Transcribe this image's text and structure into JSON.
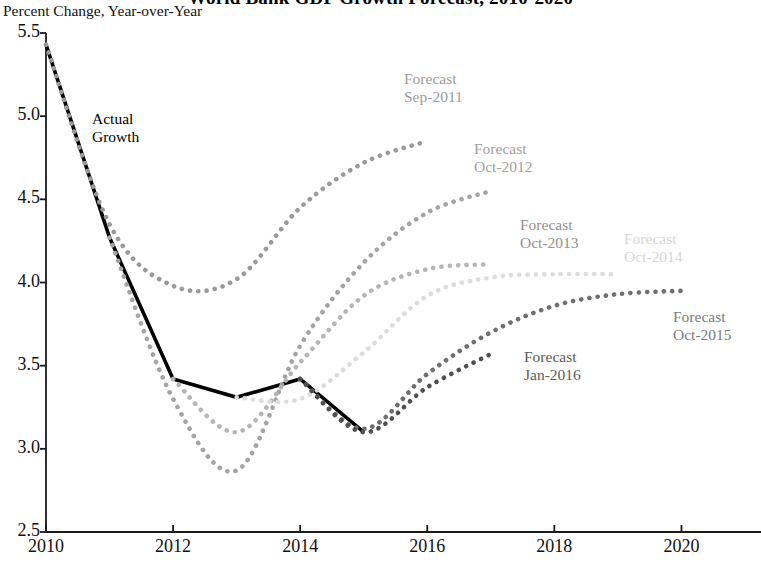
{
  "chart_data": {
    "type": "line",
    "title": "World Bank GDP Growth Forecast, 2010-2020",
    "subtitle": "Percent Change, Year-over-Year",
    "xlabel": "",
    "ylabel": "Percent Change, Year-over-Year",
    "xlim": [
      2010,
      2021
    ],
    "ylim": [
      2.5,
      5.5
    ],
    "ytick_labels": [
      "5.5",
      "5.0",
      "4.5",
      "4.0",
      "3.5",
      "3.0",
      "2.5"
    ],
    "yticks": [
      5.5,
      5.0,
      4.5,
      4.0,
      3.5,
      3.0,
      2.5
    ],
    "xtick_labels": [
      "2010",
      "2012",
      "2014",
      "2016",
      "2018",
      "2020"
    ],
    "xticks": [
      2010,
      2012,
      2014,
      2016,
      2018,
      2020
    ],
    "grid": false,
    "legend": "inline-annotations",
    "series": [
      {
        "name": "Actual Growth",
        "style": "solid",
        "color": "#000000",
        "x": [
          2010,
          2011,
          2012,
          2013,
          2014,
          2015
        ],
        "values": [
          5.43,
          4.27,
          3.42,
          3.31,
          3.42,
          3.1
        ]
      },
      {
        "name": "Forecast Sep-2011",
        "style": "dotted",
        "color": "#9a9a9a",
        "x": [
          2010,
          2011,
          2012,
          2013,
          2014,
          2015,
          2016
        ],
        "values": [
          5.43,
          4.35,
          3.98,
          4.02,
          4.45,
          4.72,
          4.85
        ]
      },
      {
        "name": "Forecast Oct-2012",
        "style": "dotted",
        "color": "#a4a4a4",
        "x": [
          2011,
          2012,
          2013,
          2014,
          2015,
          2016,
          2017
        ],
        "values": [
          4.27,
          3.3,
          2.87,
          3.62,
          4.12,
          4.42,
          4.55
        ]
      },
      {
        "name": "Forecast Oct-2013",
        "style": "dotted",
        "color": "#b5b5b5",
        "x": [
          2012,
          2013,
          2014,
          2015,
          2016,
          2017
        ],
        "values": [
          3.42,
          3.1,
          3.52,
          3.92,
          4.08,
          4.11
        ]
      },
      {
        "name": "Forecast Oct-2014",
        "style": "dotted",
        "color": "#dcdcdc",
        "x": [
          2013,
          2014,
          2015,
          2016,
          2017,
          2018,
          2019
        ],
        "values": [
          3.31,
          3.3,
          3.58,
          3.92,
          4.03,
          4.05,
          4.05
        ]
      },
      {
        "name": "Forecast Oct-2015",
        "style": "dotted",
        "color": "#6f6f6f",
        "x": [
          2014,
          2015,
          2016,
          2017,
          2018,
          2019,
          2020
        ],
        "values": [
          3.42,
          3.12,
          3.45,
          3.7,
          3.86,
          3.93,
          3.95
        ]
      },
      {
        "name": "Forecast Jan-2016",
        "style": "dotted",
        "color": "#4f4f4f",
        "x": [
          2014,
          2015,
          2016,
          2017
        ],
        "values": [
          3.42,
          3.1,
          3.37,
          3.57
        ]
      }
    ],
    "annotations": [
      {
        "id": "actual-growth",
        "line1": "Actual",
        "line2": "Growth",
        "color": "#000000",
        "x": 92,
        "y": 110
      },
      {
        "id": "sep-2011",
        "line1": "Forecast",
        "line2": "Sep-2011",
        "color": "#9a9a9a",
        "x": 404,
        "y": 70
      },
      {
        "id": "oct-2012",
        "line1": "Forecast",
        "line2": "Oct-2012",
        "color": "#a0a0a0",
        "x": 474,
        "y": 140
      },
      {
        "id": "oct-2013",
        "line1": "Forecast",
        "line2": "Oct-2013",
        "color": "#8f8f8f",
        "x": 520,
        "y": 216
      },
      {
        "id": "oct-2014",
        "line1": "Forecast",
        "line2": "Oct-2014",
        "color": "#d6d6d6",
        "x": 624,
        "y": 230
      },
      {
        "id": "oct-2015",
        "line1": "Forecast",
        "line2": "Oct-2015",
        "color": "#7a7a7a",
        "x": 673,
        "y": 308
      },
      {
        "id": "jan-2016",
        "line1": "Forecast",
        "line2": "Jan-2016",
        "color": "#5a5a5a",
        "x": 524,
        "y": 348
      }
    ]
  }
}
